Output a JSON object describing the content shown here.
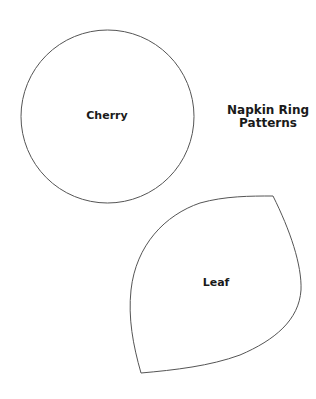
{
  "title": {
    "line1": "Napkin Ring",
    "line2": "Patterns"
  },
  "patterns": [
    {
      "name": "Cherry",
      "shape": "circle"
    },
    {
      "name": "Leaf",
      "shape": "leaf"
    }
  ],
  "colors": {
    "background": "#ffffff",
    "outline": "#555555",
    "text": "#1a1a1a"
  }
}
